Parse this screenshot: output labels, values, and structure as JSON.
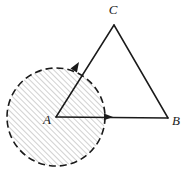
{
  "figure": {
    "canvas": {
      "width": 186,
      "height": 175,
      "background": "#ffffff"
    },
    "colors": {
      "stroke": "#1a1a1a",
      "hatch": "#9a9a9a",
      "disk_fill": "#fdfdfd",
      "label": "#1a1a1a"
    },
    "points": {
      "A": {
        "label": "A",
        "x": 56,
        "y": 117,
        "label_x": 47,
        "label_y": 121
      },
      "B": {
        "label": "B",
        "x": 168,
        "y": 118,
        "label_x": 176,
        "label_y": 122
      },
      "C": {
        "label": "C",
        "x": 114,
        "y": 25,
        "label_x": 113,
        "label_y": 11
      }
    },
    "disk": {
      "name": "hatched-disk",
      "center_x": 56,
      "center_y": 117,
      "radius": 49,
      "stroke_style": "dashed",
      "dash_length": 7,
      "dash_gap": 4,
      "stroke_width": 1.6,
      "hatch_angle_deg": 45,
      "hatch_spacing": 4,
      "hatch_width": 0.9
    },
    "segments": [
      {
        "name": "segment-AB",
        "from": "A",
        "to": "B",
        "arrow": true,
        "arrow_at": 0.5
      },
      {
        "name": "segment-AC",
        "from": "A",
        "to": "C",
        "arrow": true,
        "arrow_at": 0.41
      },
      {
        "name": "segment-CB",
        "from": "C",
        "to": "B",
        "arrow": false
      }
    ],
    "arrowheads": [
      {
        "name": "arrowhead-ab",
        "x": 113,
        "y": 117,
        "angle_deg": 0.5,
        "size": 9
      },
      {
        "name": "arrowhead-ac",
        "x": 79,
        "y": 62,
        "angle_deg": -58,
        "size": 10
      }
    ],
    "stroke_width": 1.5
  }
}
